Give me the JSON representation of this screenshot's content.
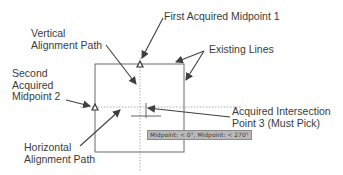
{
  "diagram": {
    "labels": {
      "first_midpoint": "First Acquired Midpoint 1",
      "vertical_path": "Vertical\nAlignment Path",
      "existing_lines": "Existing Lines",
      "second_midpoint": "Second\nAcquired\nMidpoint 2",
      "intersection": "Acquired Intersection\nPoint 3 (Must Pick)",
      "horizontal_path": "Horizontal\nAlignment Path"
    },
    "tooltip": "Midpoint: < 0°, Midpoint: < 270°",
    "icons": {
      "midpoint_marker": "triangle-icon",
      "cursor": "crosshair-icon"
    },
    "colors": {
      "line": "#6b6b6b",
      "arrow": "#3f3f3f",
      "dotted": "#9a9a9a",
      "tooltip_bg": "#b9b9b9",
      "text": "#3b3b3b"
    }
  }
}
